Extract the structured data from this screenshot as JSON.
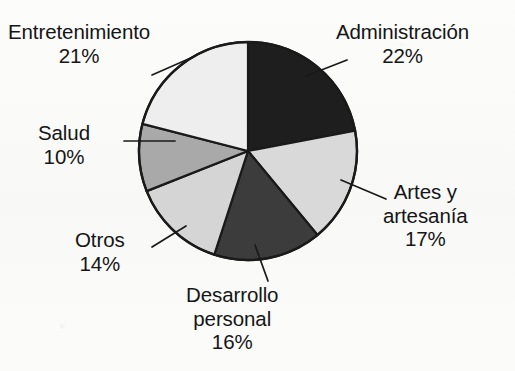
{
  "page": {
    "background_color": "#fbfbfa",
    "text_color": "#151515"
  },
  "chart_data": {
    "type": "pie",
    "title": "",
    "subtitle": "",
    "xlabel": "",
    "ylabel": "",
    "legend_position": "none",
    "labels_position": "outside-with-leader-lines",
    "grid": false,
    "units": "percent",
    "total": 100,
    "start_angle_deg": 0,
    "direction": "clockwise",
    "categories": [
      "Administración",
      "Artes y artesanía",
      "Desarrollo personal",
      "Otros",
      "Salud",
      "Entretenimiento"
    ],
    "values": [
      22,
      17,
      16,
      14,
      10,
      21
    ],
    "value_labels": [
      "22%",
      "17%",
      "16%",
      "14%",
      "10%",
      "21%"
    ],
    "colors": [
      "#1e1e1e",
      "#d9d9d9",
      "#3c3c3c",
      "#d5d5d5",
      "#a9a9a9",
      "#eeeeee"
    ],
    "slices": [
      {
        "name": "Administración",
        "label_lines": [
          "Administración"
        ],
        "value": 22,
        "value_label": "22%",
        "color": "#1e1e1e",
        "start_deg": 0,
        "end_deg": 79.2
      },
      {
        "name": "Artes y artesanía",
        "label_lines": [
          "Artes y",
          "artesanía"
        ],
        "value": 17,
        "value_label": "17%",
        "color": "#d9d9d9",
        "start_deg": 79.2,
        "end_deg": 140.4
      },
      {
        "name": "Desarrollo personal",
        "label_lines": [
          "Desarrollo",
          "personal"
        ],
        "value": 16,
        "value_label": "16%",
        "color": "#3c3c3c",
        "start_deg": 140.4,
        "end_deg": 198.0
      },
      {
        "name": "Otros",
        "label_lines": [
          "Otros"
        ],
        "value": 14,
        "value_label": "14%",
        "color": "#d5d5d5",
        "start_deg": 198.0,
        "end_deg": 248.4
      },
      {
        "name": "Salud",
        "label_lines": [
          "Salud"
        ],
        "value": 10,
        "value_label": "10%",
        "color": "#a9a9a9",
        "start_deg": 248.4,
        "end_deg": 284.4
      },
      {
        "name": "Entretenimiento",
        "label_lines": [
          "Entretenimiento"
        ],
        "value": 21,
        "value_label": "21%",
        "color": "#eeeeee",
        "start_deg": 284.4,
        "end_deg": 360.0
      }
    ],
    "geometry": {
      "center_x": 248,
      "center_y": 151,
      "radius": 109,
      "outline_color": "#1a1a1a",
      "outline_width": 2.4
    }
  },
  "labels": {
    "entretenimiento": {
      "name": "Entretenimiento",
      "pct": "21%"
    },
    "administracion": {
      "name": "Administración",
      "pct": "22%"
    },
    "artes": {
      "line1": "Artes y",
      "line2": "artesanía",
      "pct": "17%"
    },
    "desarrollo": {
      "line1": "Desarrollo",
      "line2": "personal",
      "pct": "16%"
    },
    "otros": {
      "name": "Otros",
      "pct": "14%"
    },
    "salud": {
      "name": "Salud",
      "pct": "10%"
    }
  }
}
